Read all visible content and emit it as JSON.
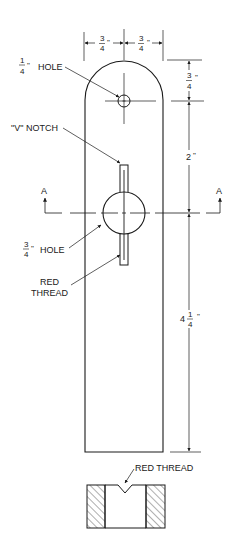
{
  "drawing": {
    "type": "technical drawing",
    "colors": {
      "line": "#1a1a1a",
      "background": "#ffffff"
    },
    "dimensions": {
      "top_left_width": {
        "num": "3",
        "den": "4",
        "unit": "\""
      },
      "top_right_width": {
        "num": "3",
        "den": "4",
        "unit": "\""
      },
      "right_top": {
        "num": "3",
        "den": "4",
        "unit": "\""
      },
      "right_middle": {
        "whole": "2",
        "unit": "\""
      },
      "right_bottom": {
        "whole": "4",
        "num": "1",
        "den": "4",
        "unit": "\""
      }
    },
    "labels": {
      "small_hole": {
        "num": "1",
        "den": "4",
        "unit": "\"",
        "text": "HOLE"
      },
      "v_notch": "\"V\" NOTCH",
      "large_hole": {
        "num": "3",
        "den": "4",
        "unit": "\"",
        "text": "HOLE"
      },
      "red_thread_line1": "RED",
      "red_thread_line2": "THREAD",
      "section_red_thread": "RED THREAD"
    },
    "section_markers": {
      "left": "A",
      "right": "A"
    }
  }
}
